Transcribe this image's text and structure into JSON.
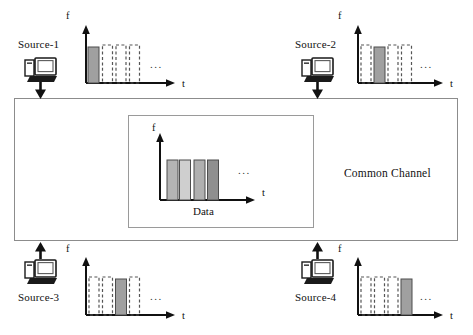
{
  "figure": {
    "channel_label": "Common Channel",
    "data_label": "Data",
    "ellipsis": "...",
    "axis": {
      "y_label": "f",
      "x_label": "t"
    },
    "colors": {
      "filled_bar": "#a0a0a0",
      "filled_bar_light": "#c0c0c0",
      "filled_bar_dark": "#8a8a8a",
      "bar_outline": "#4d4d4d",
      "dashed_bar": "#555555",
      "axis": "#111111",
      "box_border": "#8c8c8c",
      "background": "#ffffff"
    }
  },
  "channel": {
    "label": "Common Channel",
    "inner_panel": {
      "label": "Data",
      "chart": {
        "type": "bar",
        "ylabel": "f",
        "xlabel": "t",
        "categories": [
          "slot-1",
          "slot-2",
          "slot-3",
          "slot-4"
        ],
        "values": [
          1,
          1,
          1,
          1
        ],
        "bar_styles": [
          "filled",
          "filled",
          "filled",
          "filled"
        ],
        "bar_shades": [
          "#b4b4b4",
          "#cfcfcf",
          "#b0b0b0",
          "#8f8f8f"
        ],
        "ellipsis": "...",
        "grid": false
      }
    }
  },
  "sources": [
    {
      "id": "source-1",
      "label": "Source-1",
      "position": "top-left",
      "direction": "down",
      "arrow_meaning": "transmit-into-channel",
      "chart": {
        "type": "bar",
        "ylabel": "f",
        "xlabel": "t",
        "categories": [
          "slot-1",
          "slot-2",
          "slot-3",
          "slot-4"
        ],
        "values": [
          1,
          1,
          1,
          1
        ],
        "bar_styles": [
          "filled",
          "dashed",
          "dashed",
          "dashed"
        ],
        "active_slot": 1,
        "ellipsis": "...",
        "grid": false
      }
    },
    {
      "id": "source-2",
      "label": "Source-2",
      "position": "top-right",
      "direction": "down",
      "arrow_meaning": "transmit-into-channel",
      "chart": {
        "type": "bar",
        "ylabel": "f",
        "xlabel": "t",
        "categories": [
          "slot-1",
          "slot-2",
          "slot-3",
          "slot-4"
        ],
        "values": [
          1,
          1,
          1,
          1
        ],
        "bar_styles": [
          "dashed",
          "filled",
          "dashed",
          "dashed"
        ],
        "active_slot": 2,
        "ellipsis": "...",
        "grid": false
      }
    },
    {
      "id": "source-3",
      "label": "Source-3",
      "position": "bottom-left",
      "direction": "up",
      "arrow_meaning": "transmit-into-channel",
      "chart": {
        "type": "bar",
        "ylabel": "f",
        "xlabel": "t",
        "categories": [
          "slot-1",
          "slot-2",
          "slot-3",
          "slot-4"
        ],
        "values": [
          1,
          1,
          1,
          1
        ],
        "bar_styles": [
          "dashed",
          "dashed",
          "filled",
          "dashed"
        ],
        "active_slot": 3,
        "ellipsis": "...",
        "grid": false
      }
    },
    {
      "id": "source-4",
      "label": "Source-4",
      "position": "bottom-right",
      "direction": "up",
      "arrow_meaning": "transmit-into-channel",
      "chart": {
        "type": "bar",
        "ylabel": "f",
        "xlabel": "t",
        "categories": [
          "slot-1",
          "slot-2",
          "slot-3",
          "slot-4"
        ],
        "values": [
          1,
          1,
          1,
          1
        ],
        "bar_styles": [
          "dashed",
          "dashed",
          "dashed",
          "filled"
        ],
        "active_slot": 4,
        "ellipsis": "...",
        "grid": false
      }
    }
  ]
}
